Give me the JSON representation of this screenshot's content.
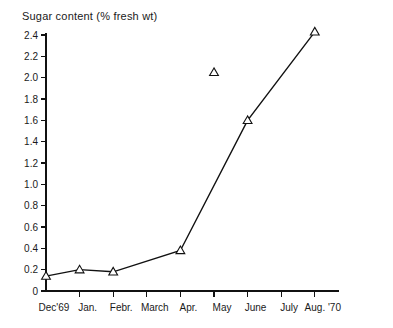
{
  "chart_data": {
    "type": "line",
    "title": "Sugar content (% fresh wt)",
    "xlabel": "",
    "ylabel": "Sugar content (% fresh wt)",
    "ylim": [
      0,
      2.4
    ],
    "grid": false,
    "legend": "none",
    "marker": "triangle-up-open",
    "categories": [
      "Dec'69",
      "Jan.",
      "Febr.",
      "March",
      "Apr.",
      "May",
      "June",
      "July",
      "Aug. '70"
    ],
    "ytick_labels": [
      "2.4",
      "2.2",
      "2.0",
      "1.8",
      "1.6",
      "1.4",
      "1.2",
      "1.0",
      "0.8",
      "0.6",
      "0.4",
      "0.2",
      "0"
    ],
    "ytick_values": [
      2.4,
      2.2,
      2.0,
      1.8,
      1.6,
      1.4,
      1.2,
      1.0,
      0.8,
      0.6,
      0.4,
      0.2,
      0
    ],
    "series": [
      {
        "name": "Sugar content",
        "connected": true,
        "points": [
          {
            "category": "Dec'69",
            "x": 0,
            "y": 0.14
          },
          {
            "category": "Jan.",
            "x": 1,
            "y": 0.2
          },
          {
            "category": "Febr.",
            "x": 2,
            "y": 0.18
          },
          {
            "category": "Apr.",
            "x": 4,
            "y": 0.38
          },
          {
            "category": "June",
            "x": 6,
            "y": 1.6
          },
          {
            "category": "Aug. '70",
            "x": 8,
            "y": 2.43
          }
        ]
      },
      {
        "name": "May isolated observation",
        "connected": false,
        "points": [
          {
            "category": "May",
            "x": 5,
            "y": 2.05
          }
        ]
      }
    ]
  },
  "axes": {
    "y_axis_name": "sugar-content-axis",
    "x_axis_name": "month-axis"
  }
}
